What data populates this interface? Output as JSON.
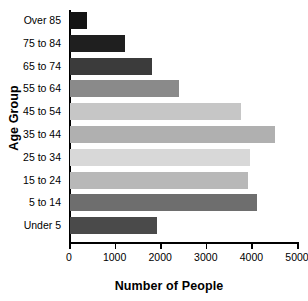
{
  "chart_data": {
    "type": "bar",
    "orientation": "horizontal",
    "title": "",
    "xlabel": "Number of People",
    "ylabel": "Age Group",
    "categories": [
      "Over 85",
      "75 to 84",
      "65 to 74",
      "55 to 64",
      "45 to 54",
      "35 to 44",
      "25 to 34",
      "15 to 24",
      "5 to 14",
      "Under 5"
    ],
    "values": [
      380,
      1200,
      1800,
      2400,
      3750,
      4500,
      3950,
      3900,
      4100,
      1900
    ],
    "bar_colors": [
      "#141414",
      "#1f1f1f",
      "#3b3b3b",
      "#8a8a8a",
      "#c6c6c6",
      "#b0b0b0",
      "#d8d8d8",
      "#b8b8b8",
      "#6e6e6e",
      "#4a4a4a"
    ],
    "xlim": [
      0,
      5000
    ],
    "xticks": [
      0,
      1000,
      2000,
      3000,
      4000,
      5000
    ],
    "xtick_labels": [
      "0",
      "1000",
      "2000",
      "3000",
      "4000",
      "5000"
    ],
    "grid": false,
    "legend": false
  }
}
